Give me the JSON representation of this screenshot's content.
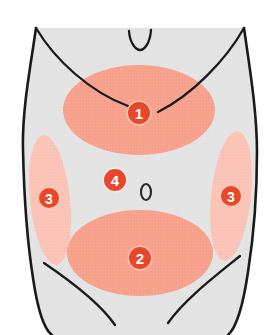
{
  "figure": {
    "background_color": "#ffffff",
    "body_fill_color": "#e3e3e3",
    "outline_color": "#1a1a1a",
    "badge_color": "#e8472a",
    "badge_text_color": "#ffffff",
    "region_primary_color": "#f7a08c",
    "region_secondary_color": "#fbc3b6",
    "navel_color": "#2b2b2b"
  },
  "regions": [
    {
      "id": "region-1",
      "label": "1",
      "name": "upper-abdomen-region",
      "color": "#f7a08c",
      "shape": "ellipse",
      "cx": 139,
      "cy": 110,
      "rx": 76,
      "ry": 45,
      "badge_x": 139,
      "badge_y": 113,
      "badge_r": 12
    },
    {
      "id": "region-2",
      "label": "2",
      "name": "lower-abdomen-region",
      "color": "#f7a08c",
      "shape": "ellipse",
      "cx": 140,
      "cy": 253,
      "rx": 73,
      "ry": 43,
      "badge_x": 140,
      "badge_y": 258,
      "badge_r": 12
    },
    {
      "id": "region-3-left",
      "label": "3",
      "name": "left-flank-region",
      "color": "#fbc3b6",
      "shape": "ellipse",
      "cx": 50,
      "cy": 200,
      "rx": 20,
      "ry": 65,
      "rotate": -6,
      "badge_x": 49,
      "badge_y": 198,
      "badge_r": 11
    },
    {
      "id": "region-3-right",
      "label": "3",
      "name": "right-flank-region",
      "color": "#fbc3b6",
      "shape": "ellipse",
      "cx": 231,
      "cy": 196,
      "rx": 20,
      "ry": 65,
      "rotate": 6,
      "badge_x": 231,
      "badge_y": 196,
      "badge_r": 11
    },
    {
      "id": "region-4",
      "label": "4",
      "name": "periumbilical-region",
      "color": null,
      "shape": "badge-only",
      "badge_x": 115,
      "badge_y": 180,
      "badge_r": 12
    }
  ],
  "navel": {
    "name": "navel-marker",
    "label": "0",
    "x": 146,
    "y": 192,
    "rx": 5,
    "ry": 8
  },
  "anatomy": {
    "torso_outline_name": "torso-outline",
    "rib_line_left_name": "left-costal-margin-line",
    "rib_line_right_name": "right-costal-margin-line",
    "inguinal_line_left_name": "left-inguinal-crease-line",
    "inguinal_line_right_name": "right-inguinal-crease-line",
    "sternum_notch_name": "xiphoid-notch"
  }
}
